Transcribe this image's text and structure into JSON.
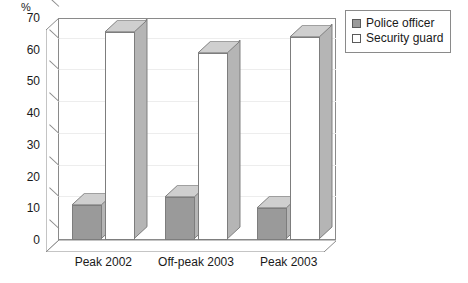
{
  "chart_data": {
    "type": "bar",
    "title": "",
    "subtitle": "",
    "xlabel": "",
    "ylabel": "%",
    "y_unit": "%",
    "ylim": [
      0,
      70
    ],
    "y_ticks": [
      0,
      10,
      20,
      30,
      40,
      50,
      60,
      70
    ],
    "y_tick_labels": [
      "0",
      "10",
      "20",
      "30",
      "40",
      "50",
      "60",
      "70"
    ],
    "grid": true,
    "grid_axis": "y",
    "three_d": true,
    "legend_position": "top-right",
    "categories": [
      "Peak 2002",
      "Off-peak 2003",
      "Peak 2003"
    ],
    "series": [
      {
        "name": "Police officer",
        "color": "#9a9a9a",
        "values": [
          11,
          13.5,
          10
        ]
      },
      {
        "name": "Security guard",
        "color": "#ffffff",
        "values": [
          65.5,
          59,
          64
        ]
      }
    ],
    "annotations": []
  },
  "legend": {
    "items": [
      {
        "label": "Police officer",
        "swatch": "filled-square-icon"
      },
      {
        "label": "Security guard",
        "swatch": "empty-square-icon"
      }
    ]
  },
  "colors": {
    "series_police": "#9a9a9a",
    "series_security": "#ffffff",
    "axis": "#8a8a8a",
    "gridline": "#ededed",
    "bar_outline": "#7d7d7d",
    "bar_top_face": "#cfcfcf",
    "bar_side_face": "#b5b5b5",
    "text": "#1a1a1a",
    "background": "#ffffff"
  }
}
